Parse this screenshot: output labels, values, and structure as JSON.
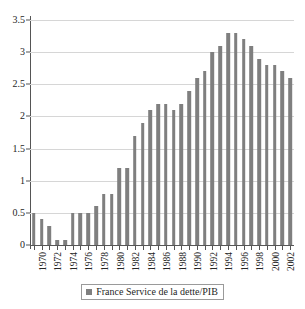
{
  "chart_data": {
    "type": "bar",
    "title": "",
    "subtitle": "",
    "xlabel": "",
    "ylabel": "",
    "grid": true,
    "legend_position": "bottom",
    "ylim": [
      0,
      3.5
    ],
    "yticks": [
      "0",
      "0.5",
      "1",
      "1.5",
      "2",
      "2.5",
      "3",
      "3.5"
    ],
    "ytick_values": [
      0,
      0.5,
      1,
      1.5,
      2,
      2.5,
      3,
      3.5
    ],
    "xtick_labels": [
      "1970",
      "1972",
      "1974",
      "1976",
      "1978",
      "1980",
      "1982",
      "1984",
      "1986",
      "1988",
      "1990",
      "1992",
      "1994",
      "1996",
      "1998",
      "2000",
      "2002"
    ],
    "categories": [
      "1970",
      "1971",
      "1972",
      "1973",
      "1974",
      "1975",
      "1976",
      "1977",
      "1978",
      "1979",
      "1980",
      "1981",
      "1982",
      "1983",
      "1984",
      "1985",
      "1986",
      "1987",
      "1988",
      "1989",
      "1990",
      "1991",
      "1992",
      "1993",
      "1994",
      "1995",
      "1996",
      "1997",
      "1998",
      "1999",
      "2000",
      "2001",
      "2002",
      "2003"
    ],
    "series": [
      {
        "name": "France Service de la dette/PIB",
        "color": "#7f7f7f",
        "values": [
          0.5,
          0.4,
          0.3,
          0.08,
          0.08,
          0.5,
          0.5,
          0.5,
          0.6,
          0.8,
          0.8,
          1.2,
          1.2,
          1.7,
          1.9,
          2.1,
          2.2,
          2.2,
          2.1,
          2.2,
          2.4,
          2.6,
          2.7,
          3.0,
          3.1,
          3.3,
          3.3,
          3.2,
          3.1,
          2.9,
          2.8,
          2.8,
          2.7,
          2.6
        ]
      }
    ]
  },
  "legend": {
    "label": "France Service de la dette/PIB",
    "swatch_color": "#7f7f7f"
  },
  "axis": {
    "y_max_label": "3.5",
    "y_min_label": "0"
  }
}
